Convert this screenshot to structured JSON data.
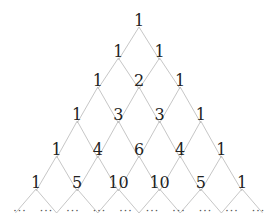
{
  "rows": [
    [
      "1"
    ],
    [
      "1",
      "1"
    ],
    [
      "1",
      "2",
      "1"
    ],
    [
      "1",
      "3",
      "3",
      "1"
    ],
    [
      "1",
      "4",
      "6",
      "4",
      "1"
    ],
    [
      "1",
      "5",
      "10",
      "10",
      "5",
      "1"
    ]
  ],
  "continuation": "···",
  "continuation_count": 10,
  "colors": {
    "text": "#222222",
    "lines": "#b8b8b8",
    "background": "#ffffff"
  }
}
